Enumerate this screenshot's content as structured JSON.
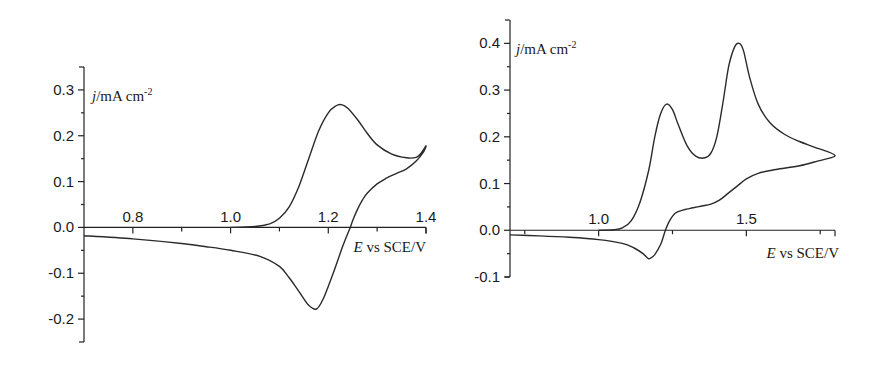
{
  "chart_data": [
    {
      "type": "line",
      "title": "",
      "xlabel": "E vs SCE/V",
      "ylabel": "j/mA cm-2",
      "xlabel_parts": {
        "var": "E",
        "rest": " vs SCE/V"
      },
      "ylabel_parts": {
        "var": "j",
        "rest": "/mA cm",
        "sup": "-2"
      },
      "xlim": [
        0.7,
        1.4
      ],
      "ylim": [
        -0.25,
        0.35
      ],
      "xticks": [
        0.8,
        1.0,
        1.2,
        1.4
      ],
      "xtick_labels": [
        "0.8",
        "1.0",
        "1.2",
        "1.4"
      ],
      "xminor": [
        0.9,
        1.1,
        1.3
      ],
      "yticks": [
        -0.2,
        -0.1,
        0.0,
        0.1,
        0.2,
        0.3
      ],
      "ytick_labels": [
        "-0.2",
        "-0.1",
        "0.0",
        "0.1",
        "0.2",
        "0.3"
      ],
      "grid": false,
      "legend": null,
      "series": [
        {
          "name": "cyclic voltammogram",
          "x": [
            1.0,
            1.05,
            1.08,
            1.1,
            1.12,
            1.14,
            1.16,
            1.18,
            1.2,
            1.215,
            1.227,
            1.24,
            1.26,
            1.28,
            1.3,
            1.33,
            1.36,
            1.38,
            1.39,
            1.4,
            1.395,
            1.38,
            1.36,
            1.34,
            1.32,
            1.3,
            1.28,
            1.27,
            1.26,
            1.25,
            1.245,
            1.23,
            1.21,
            1.19,
            1.176,
            1.16,
            1.14,
            1.12,
            1.1,
            1.06,
            1.0,
            0.95,
            0.9,
            0.8,
            0.7
          ],
          "y": [
            0.0,
            0.002,
            0.008,
            0.02,
            0.045,
            0.09,
            0.15,
            0.21,
            0.25,
            0.265,
            0.268,
            0.26,
            0.235,
            0.205,
            0.18,
            0.16,
            0.152,
            0.153,
            0.162,
            0.178,
            0.165,
            0.145,
            0.128,
            0.118,
            0.108,
            0.095,
            0.075,
            0.06,
            0.04,
            0.015,
            0.0,
            -0.04,
            -0.1,
            -0.155,
            -0.178,
            -0.17,
            -0.14,
            -0.11,
            -0.085,
            -0.063,
            -0.05,
            -0.042,
            -0.035,
            -0.025,
            -0.018
          ]
        }
      ]
    },
    {
      "type": "line",
      "title": "",
      "xlabel": "E vs SCE/V",
      "ylabel": "j/mA cm-2",
      "xlabel_parts": {
        "var": "E",
        "rest": " vs SCE/V"
      },
      "ylabel_parts": {
        "var": "j",
        "rest": "/mA cm",
        "sup": "-2"
      },
      "xlim": [
        0.7,
        1.8
      ],
      "ylim": [
        -0.1,
        0.45
      ],
      "xticks": [
        1.0,
        1.5
      ],
      "xtick_labels": [
        "1.0",
        "1.5"
      ],
      "xminor": [
        0.75,
        1.25,
        1.75
      ],
      "yticks": [
        -0.1,
        0.0,
        0.1,
        0.2,
        0.3,
        0.4
      ],
      "ytick_labels": [
        "-0.1",
        "0.0",
        "0.1",
        "0.2",
        "0.3",
        "0.4"
      ],
      "grid": false,
      "legend": null,
      "series": [
        {
          "name": "cyclic voltammogram",
          "x": [
            1.0,
            1.05,
            1.08,
            1.11,
            1.14,
            1.17,
            1.19,
            1.21,
            1.23,
            1.25,
            1.27,
            1.3,
            1.33,
            1.36,
            1.38,
            1.4,
            1.42,
            1.44,
            1.46,
            1.476,
            1.49,
            1.51,
            1.54,
            1.58,
            1.63,
            1.68,
            1.73,
            1.8,
            1.74,
            1.68,
            1.6,
            1.54,
            1.5,
            1.47,
            1.44,
            1.41,
            1.38,
            1.35,
            1.32,
            1.29,
            1.26,
            1.24,
            1.226,
            1.21,
            1.19,
            1.175,
            1.167,
            1.15,
            1.12,
            1.08,
            1.0,
            0.9,
            0.8,
            0.7
          ],
          "y": [
            0.0,
            0.001,
            0.005,
            0.02,
            0.06,
            0.13,
            0.2,
            0.25,
            0.27,
            0.258,
            0.225,
            0.18,
            0.158,
            0.155,
            0.165,
            0.2,
            0.27,
            0.35,
            0.392,
            0.4,
            0.385,
            0.33,
            0.27,
            0.23,
            0.205,
            0.19,
            0.178,
            0.16,
            0.148,
            0.138,
            0.13,
            0.122,
            0.11,
            0.095,
            0.08,
            0.065,
            0.056,
            0.052,
            0.048,
            0.044,
            0.037,
            0.02,
            0.0,
            -0.03,
            -0.052,
            -0.06,
            -0.06,
            -0.05,
            -0.038,
            -0.028,
            -0.02,
            -0.015,
            -0.012,
            -0.01
          ]
        }
      ]
    }
  ]
}
